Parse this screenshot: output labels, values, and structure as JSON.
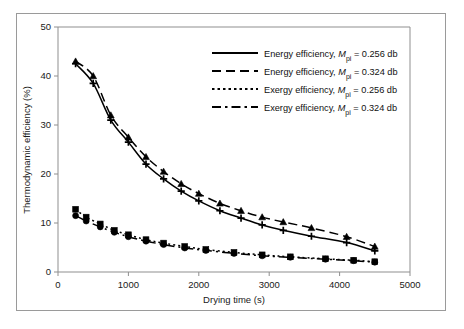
{
  "chart_data": {
    "type": "line",
    "title": "",
    "xlabel": "Drying time (s)",
    "ylabel": "Thermodynamic efficiency (%)",
    "xlim": [
      0,
      5000
    ],
    "ylim": [
      0,
      50
    ],
    "xticks": [
      0,
      1000,
      2000,
      3000,
      4000,
      5000
    ],
    "yticks": [
      0,
      10,
      20,
      30,
      40,
      50
    ],
    "xtick_labels": [
      "0",
      "1000",
      "2000",
      "3000",
      "4000",
      "5000"
    ],
    "ytick_labels": [
      "0",
      "10",
      "20",
      "30",
      "40",
      "50"
    ],
    "grid": false,
    "legend_position": "upper-right",
    "series": [
      {
        "name": "Energy efficiency, Mpi = 0.256 db",
        "label_prefix": "Energy efficiency, ",
        "symbol": "M",
        "subscript": "pi",
        "label_suffix": " = 0.256 db",
        "linestyle": "solid",
        "marker": "plus",
        "color": "#000000",
        "x": [
          250,
          500,
          750,
          1000,
          1250,
          1500,
          1750,
          2000,
          2300,
          2600,
          2900,
          3200,
          3600,
          4100,
          4500
        ],
        "y": [
          42.5,
          38.5,
          31.0,
          26.5,
          22.0,
          19.0,
          16.5,
          14.5,
          12.5,
          11.0,
          9.6,
          8.5,
          7.3,
          6.0,
          4.3
        ]
      },
      {
        "name": "Energy efficiency, Mpi = 0.324 db",
        "label_prefix": "Energy efficiency, ",
        "symbol": "M",
        "subscript": "pi",
        "label_suffix": " = 0.324 db",
        "linestyle": "dashed",
        "marker": "triangle",
        "color": "#000000",
        "x": [
          250,
          500,
          750,
          1000,
          1250,
          1500,
          1750,
          2000,
          2300,
          2600,
          2900,
          3200,
          3600,
          4100,
          4500
        ],
        "y": [
          43.0,
          40.0,
          32.0,
          27.5,
          23.5,
          20.5,
          18.0,
          16.0,
          14.0,
          12.5,
          11.2,
          10.2,
          9.0,
          7.2,
          5.2
        ]
      },
      {
        "name": "Exergy efficiency, Mpi = 0.256 db",
        "label_prefix": "Exergy efficiency, ",
        "symbol": "M",
        "subscript": "pi",
        "label_suffix": " = 0.256 db",
        "linestyle": "dotted",
        "marker": "square",
        "color": "#000000",
        "x": [
          250,
          400,
          600,
          800,
          1000,
          1250,
          1500,
          1800,
          2100,
          2500,
          2900,
          3300,
          3800,
          4200,
          4500
        ],
        "y": [
          12.8,
          11.2,
          9.8,
          8.5,
          7.6,
          6.6,
          5.9,
          5.2,
          4.6,
          4.0,
          3.5,
          3.1,
          2.7,
          2.4,
          2.1
        ]
      },
      {
        "name": "Exergy efficiency, Mpi = 0.324 db",
        "label_prefix": "Exergy efficiency, ",
        "symbol": "M",
        "subscript": "pi",
        "label_suffix": " = 0.324 db",
        "linestyle": "dashdot",
        "marker": "circle",
        "color": "#000000",
        "x": [
          250,
          400,
          600,
          800,
          1000,
          1250,
          1500,
          1800,
          2100,
          2500,
          2900,
          3300,
          3800,
          4200,
          4500
        ],
        "y": [
          11.5,
          10.4,
          9.2,
          8.1,
          7.2,
          6.3,
          5.6,
          4.9,
          4.4,
          3.8,
          3.3,
          3.0,
          2.6,
          2.3,
          2.0
        ]
      }
    ]
  },
  "axes": {
    "x_title": "Drying time (s)",
    "y_title": "Thermodynamic efficiency (%)"
  }
}
